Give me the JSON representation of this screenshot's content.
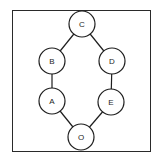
{
  "diagram": {
    "type": "graph",
    "nodes": [
      {
        "id": "C",
        "label": "C",
        "x": 82,
        "y": 24
      },
      {
        "id": "B",
        "label": "B",
        "x": 52,
        "y": 61
      },
      {
        "id": "D",
        "label": "D",
        "x": 112,
        "y": 61
      },
      {
        "id": "A",
        "label": "A",
        "x": 52,
        "y": 101
      },
      {
        "id": "E",
        "label": "E",
        "x": 111,
        "y": 102
      },
      {
        "id": "O",
        "label": "O",
        "x": 81,
        "y": 137
      }
    ],
    "edges": [
      {
        "from": "C",
        "to": "B"
      },
      {
        "from": "C",
        "to": "D"
      },
      {
        "from": "B",
        "to": "A"
      },
      {
        "from": "D",
        "to": "E"
      },
      {
        "from": "A",
        "to": "O"
      },
      {
        "from": "E",
        "to": "O"
      }
    ],
    "node_radius": 13,
    "colors": {
      "stroke": "#1e1e1e",
      "fill": "#ffffff",
      "frame": "#2a2a2a"
    }
  }
}
